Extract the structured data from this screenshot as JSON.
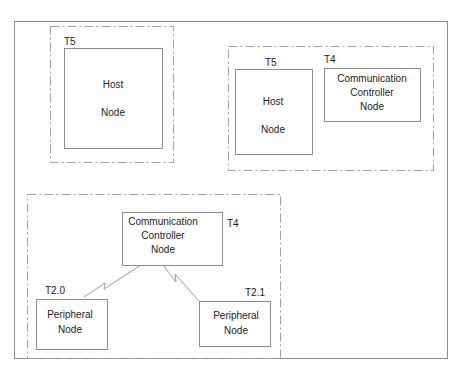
{
  "diagram": {
    "groups": [
      {
        "id": "group-top-left",
        "nodes": [
          {
            "type_label": "T5",
            "lines": [
              "Host",
              "Node"
            ]
          }
        ]
      },
      {
        "id": "group-top-right",
        "nodes": [
          {
            "type_label": "T5",
            "lines": [
              "Host",
              "Node"
            ]
          },
          {
            "type_label": "T4",
            "lines": [
              "Communication",
              "Controller",
              "Node"
            ]
          }
        ]
      },
      {
        "id": "group-bottom",
        "nodes": [
          {
            "type_label": "T4",
            "lines": [
              "Communication",
              "Controller",
              "Node"
            ]
          },
          {
            "type_label": "T2.0",
            "lines": [
              "Peripheral",
              "Node"
            ]
          },
          {
            "type_label": "T2.1",
            "lines": [
              "Peripheral",
              "Node"
            ]
          }
        ],
        "links": [
          {
            "from": "Communication Controller Node",
            "to": "Peripheral Node (T2.0)",
            "style": "zigzag"
          },
          {
            "from": "Communication Controller Node",
            "to": "Peripheral Node (T2.1)",
            "style": "zigzag"
          }
        ]
      }
    ],
    "colors": {
      "line": "#9a9a9a",
      "dash": "#a0a0a0",
      "text": "#222222"
    }
  }
}
